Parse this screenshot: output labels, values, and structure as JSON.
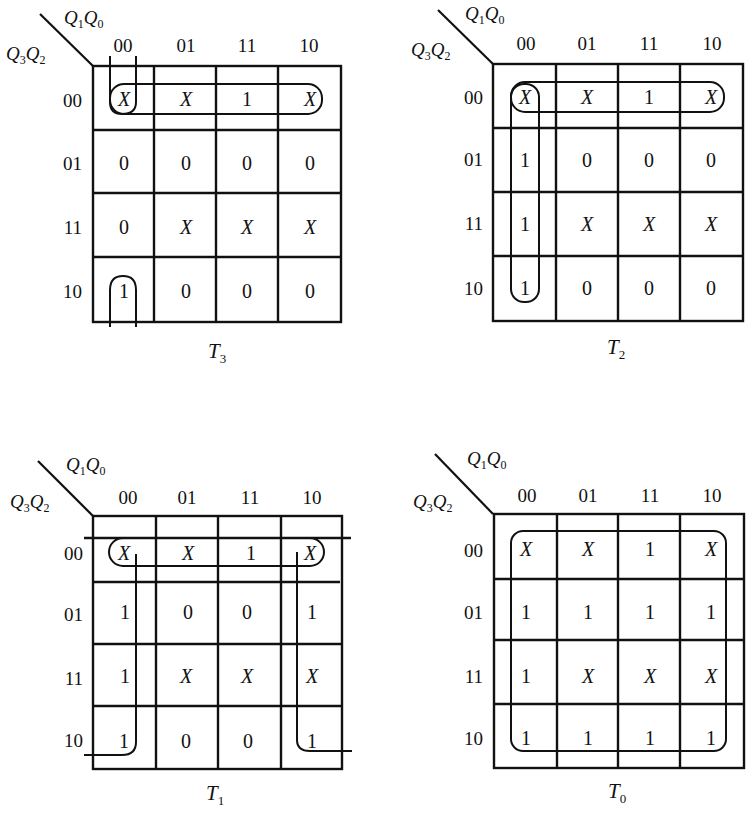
{
  "figure": {
    "row_var_label": {
      "main": "Q",
      "sub1": "3",
      "mid": "Q",
      "sub2": "2"
    },
    "col_var_label": {
      "main": "Q",
      "sub1": "1",
      "mid": "Q",
      "sub2": "0"
    },
    "col_headers": [
      "00",
      "01",
      "11",
      "10"
    ],
    "row_headers": [
      "00",
      "01",
      "11",
      "10"
    ]
  },
  "kmaps": [
    {
      "name": "T3",
      "title": {
        "main": "T",
        "sub": "3"
      },
      "cells": [
        [
          "X",
          "X",
          "1",
          "X"
        ],
        [
          "0",
          "0",
          "0",
          "0"
        ],
        [
          "0",
          "X",
          "X",
          "X"
        ],
        [
          "1",
          "0",
          "0",
          "0"
        ]
      ],
      "groupings": [
        "row 00 (all four cells)",
        "column 00 rows 10 and 00 (wrap-around)"
      ]
    },
    {
      "name": "T2",
      "title": {
        "main": "T",
        "sub": "2"
      },
      "cells": [
        [
          "X",
          "X",
          "1",
          "X"
        ],
        [
          "1",
          "0",
          "0",
          "0"
        ],
        [
          "1",
          "X",
          "X",
          "X"
        ],
        [
          "1",
          "0",
          "0",
          "0"
        ]
      ],
      "groupings": [
        "row 00 (all four cells)",
        "column 00 (all four cells)"
      ]
    },
    {
      "name": "T1",
      "title": {
        "main": "T",
        "sub": "1"
      },
      "cells": [
        [
          "X",
          "X",
          "1",
          "X"
        ],
        [
          "1",
          "0",
          "0",
          "1"
        ],
        [
          "1",
          "X",
          "X",
          "X"
        ],
        [
          "1",
          "0",
          "0",
          "1"
        ]
      ],
      "groupings": [
        "row 00 (all four cells)",
        "columns 00 and 10 (wrap-around, eight cells)"
      ]
    },
    {
      "name": "T0",
      "title": {
        "main": "T",
        "sub": "0"
      },
      "cells": [
        [
          "X",
          "X",
          "1",
          "X"
        ],
        [
          "1",
          "1",
          "1",
          "1"
        ],
        [
          "1",
          "X",
          "X",
          "X"
        ],
        [
          "1",
          "1",
          "1",
          "1"
        ]
      ],
      "groupings": [
        "entire map (all sixteen cells)"
      ]
    }
  ]
}
